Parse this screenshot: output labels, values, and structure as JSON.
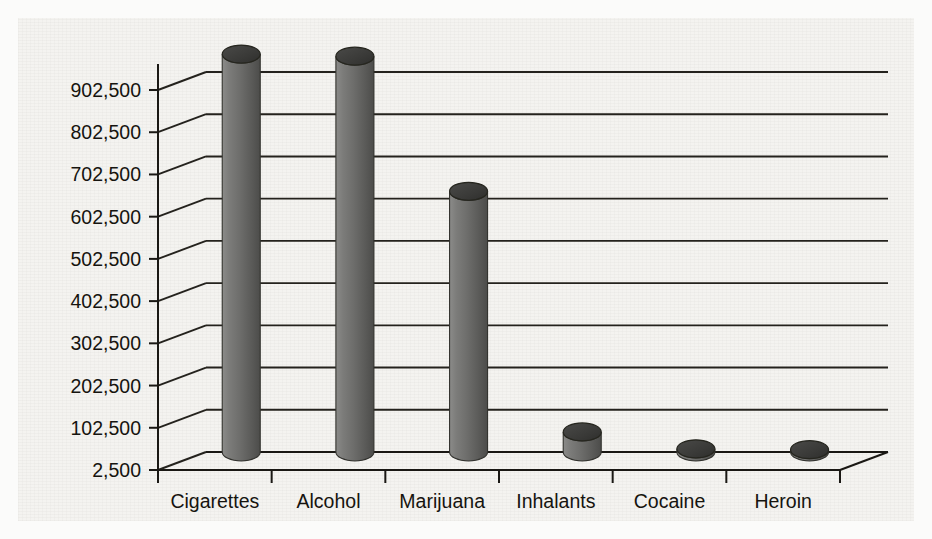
{
  "chart_data": {
    "type": "bar",
    "title": "",
    "subtitle": "",
    "xlabel": "",
    "ylabel": "",
    "categories": [
      "Cigarettes",
      "Alcohol",
      "Marijuana",
      "Inhalants",
      "Cocaine",
      "Heroin"
    ],
    "values": [
      945000,
      940000,
      620000,
      50000,
      10000,
      8000
    ],
    "ytick_labels": [
      "2,500",
      "102,500",
      "202,500",
      "302,500",
      "402,500",
      "502,500",
      "602,500",
      "702,500",
      "802,500",
      "902,500"
    ],
    "ytick_values": [
      2500,
      102500,
      202500,
      302500,
      402500,
      502500,
      602500,
      702500,
      802500,
      902500
    ],
    "ylim": [
      2500,
      952500
    ],
    "grid": true,
    "legend": "none",
    "style": "3d-cylinder",
    "annotations": []
  },
  "colors": {
    "paper": "#f4f3f0",
    "page": "#fbfbfa",
    "ink": "#16140f",
    "axis": "#1a1814",
    "grid": "#24221d",
    "bar_fill": "#6e6e6c",
    "bar_light": "#8f8f8d",
    "bar_dark": "#4a4a48",
    "bar_top": "#3b3b39"
  },
  "ghost_text": "                                                                                     \n                                                                                     \n                                                                                     \n                                                                                     \n                                                                                     \n                                                                                     \n                                                                                     "
}
